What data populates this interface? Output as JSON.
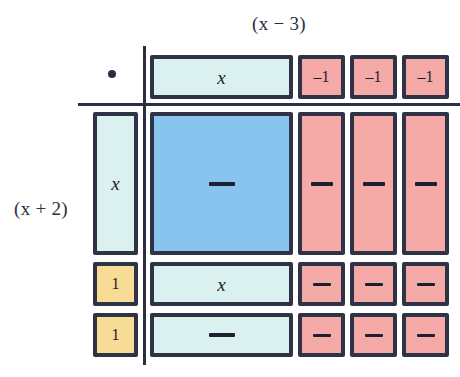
{
  "diagram": {
    "type": "algebra-tiles-area-model",
    "top_factor_label": "(x − 3)",
    "left_factor_label": "(x + 2)",
    "operator_symbol": "•",
    "colors": {
      "cyan_x_tile": "#DAF1EF",
      "pink_negative_tile": "#F6AAA8",
      "yellow_unit_tile": "#F8DC95",
      "blue_x_squared_tile": "#87C5EF",
      "outline": "#2F3346",
      "rule": "#2B2F44",
      "background": "#FFFFFF"
    },
    "column_headers": [
      {
        "label": "x",
        "kind": "x-tile",
        "color": "cyan"
      },
      {
        "label": "–1",
        "kind": "negative-unit",
        "color": "pink"
      },
      {
        "label": "–1",
        "kind": "negative-unit",
        "color": "pink"
      },
      {
        "label": "–1",
        "kind": "negative-unit",
        "color": "pink"
      }
    ],
    "row_headers": [
      {
        "label": "x",
        "kind": "x-tile",
        "color": "cyan"
      },
      {
        "label": "1",
        "kind": "unit",
        "color": "yellow"
      },
      {
        "label": "1",
        "kind": "unit",
        "color": "yellow"
      }
    ],
    "product_cells": [
      [
        {
          "label": "—",
          "kind": "x-squared",
          "color": "blue"
        },
        {
          "label": "—",
          "kind": "negative-x",
          "color": "pink"
        },
        {
          "label": "—",
          "kind": "negative-x",
          "color": "pink"
        },
        {
          "label": "—",
          "kind": "negative-x",
          "color": "pink"
        }
      ],
      [
        {
          "label": "x",
          "kind": "x-tile",
          "color": "cyan"
        },
        {
          "label": "—",
          "kind": "negative-unit",
          "color": "pink"
        },
        {
          "label": "—",
          "kind": "negative-unit",
          "color": "pink"
        },
        {
          "label": "—",
          "kind": "negative-unit",
          "color": "pink"
        }
      ],
      [
        {
          "label": "—",
          "kind": "x-tile",
          "color": "cyan"
        },
        {
          "label": "—",
          "kind": "negative-unit",
          "color": "pink"
        },
        {
          "label": "—",
          "kind": "negative-unit",
          "color": "pink"
        },
        {
          "label": "—",
          "kind": "negative-unit",
          "color": "pink"
        }
      ]
    ]
  }
}
